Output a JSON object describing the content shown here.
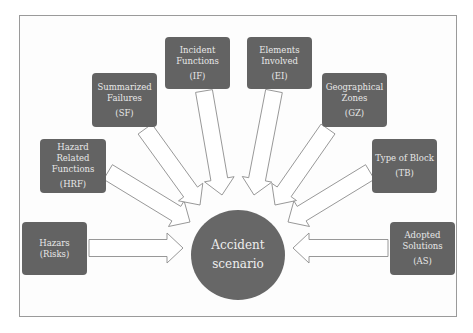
{
  "diagram": {
    "center": {
      "line1": "Accident",
      "line2": "scenario"
    },
    "nodes": [
      {
        "id": "hazars",
        "lines": [
          "Hazars",
          "(Risks)"
        ],
        "abbr": "",
        "box": [
          22,
          222,
          65,
          53
        ]
      },
      {
        "id": "hrf",
        "lines": [
          "Hazard",
          "Related",
          "Functions"
        ],
        "abbr": "(HRF)",
        "box": [
          40,
          139,
          66,
          54
        ]
      },
      {
        "id": "sf",
        "lines": [
          "Summarized",
          "Failures"
        ],
        "abbr": "(SF)",
        "box": [
          92,
          73,
          65,
          54
        ]
      },
      {
        "id": "if",
        "lines": [
          "Incident",
          "Functions"
        ],
        "abbr": "(IF)",
        "box": [
          165,
          37,
          65,
          52
        ]
      },
      {
        "id": "ei",
        "lines": [
          "Elements",
          "Involved"
        ],
        "abbr": "(EI)",
        "box": [
          247,
          37,
          65,
          52
        ]
      },
      {
        "id": "gz",
        "lines": [
          "Geographical",
          "Zones"
        ],
        "abbr": "(GZ)",
        "box": [
          322,
          73,
          65,
          54
        ]
      },
      {
        "id": "tb",
        "lines": [
          "Type of Block"
        ],
        "abbr": "(TB)",
        "box": [
          372,
          139,
          65,
          54
        ]
      },
      {
        "id": "as",
        "lines": [
          "Adopted",
          "Solutions"
        ],
        "abbr": "(AS)",
        "box": [
          390,
          222,
          65,
          53
        ]
      }
    ],
    "arrows": [
      {
        "from": "hazars",
        "tail": [
          89,
          248
        ],
        "head": [
          183,
          248
        ]
      },
      {
        "from": "hrf",
        "tail": [
          108,
          172
        ],
        "head": [
          190,
          222
        ]
      },
      {
        "from": "sf",
        "tail": [
          145,
          129
        ],
        "head": [
          200,
          205
        ]
      },
      {
        "from": "if",
        "tail": [
          204,
          91
        ],
        "head": [
          222,
          195
        ]
      },
      {
        "from": "ei",
        "tail": [
          274,
          91
        ],
        "head": [
          254,
          195
        ]
      },
      {
        "from": "gz",
        "tail": [
          328,
          129
        ],
        "head": [
          275,
          205
        ]
      },
      {
        "from": "tb",
        "tail": [
          370,
          172
        ],
        "head": [
          288,
          222
        ]
      },
      {
        "from": "as",
        "tail": [
          388,
          248
        ],
        "head": [
          293,
          248
        ]
      }
    ],
    "colors": {
      "node_fill": "#636363",
      "node_text": "#e8e8e8",
      "center_fill": "#676767",
      "arrow_stroke": "#8c8c8c",
      "frame_border": "#9a9a9a"
    }
  }
}
